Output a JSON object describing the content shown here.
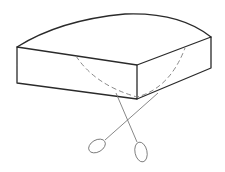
{
  "diagram": {
    "colors": {
      "background": "#ffffff",
      "outline": "#2a2a2a",
      "dashed": "#7a7a7a",
      "probe": "#6a6a6a"
    },
    "elements": [
      {
        "id": "block-body",
        "type": "box",
        "style": "solid"
      },
      {
        "id": "curved-top",
        "type": "arc",
        "style": "solid"
      },
      {
        "id": "hidden-curve",
        "type": "arc",
        "style": "dashed"
      },
      {
        "id": "probe-left",
        "type": "line-with-ellipse",
        "style": "thin"
      },
      {
        "id": "probe-right",
        "type": "line-with-ellipse",
        "style": "thin"
      }
    ]
  }
}
